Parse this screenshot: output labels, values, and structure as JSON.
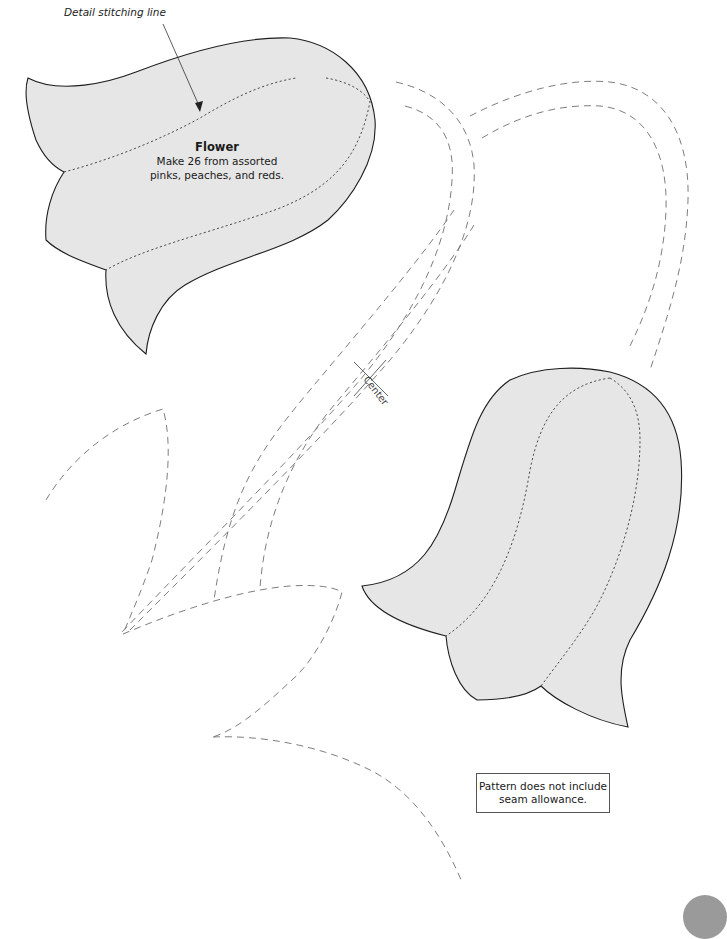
{
  "annotations": {
    "detail_stitching_callout": "Detail stitching line",
    "center_mark_label": "Center"
  },
  "flower_piece": {
    "title": "Flower",
    "instructions_line1": "Make 26 from assorted",
    "instructions_line2": "pinks, peaches, and reds."
  },
  "note": {
    "line1": "Pattern does not include",
    "line2": "seam allowance."
  },
  "colors": {
    "flower_fill": "#e6e6e6",
    "outline": "#1e1e1e",
    "placement_dash": "#6e6e6e",
    "page_tab": "#9a9a9a",
    "background": "#ffffff"
  },
  "icons": {
    "center_mark": "crosshair-x",
    "callout_arrow": "arrow-leader",
    "page_tab": "grey-circle-tab"
  }
}
